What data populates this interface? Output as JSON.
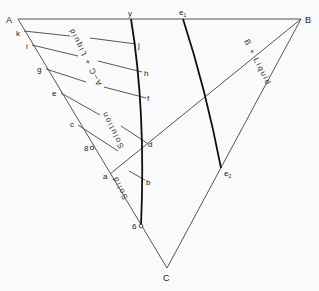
{
  "diagram": {
    "type": "ternary-phase-diagram",
    "vertices": {
      "A": "A",
      "B": "B",
      "C": "C"
    },
    "point_labels": {
      "y": "y",
      "e1": "e",
      "e1_sub": "1",
      "e2": "e",
      "e2_sub": "2",
      "k": "k",
      "i": "i",
      "g": "g",
      "e": "e",
      "c": "c",
      "p8": "8",
      "a": "a",
      "p6": "6",
      "j": "j",
      "h": "h",
      "f": "f",
      "d": "d",
      "b": "b"
    },
    "regions": {
      "ac_liquid": "A–C + Liquid",
      "solution": "Solution",
      "solid": "Solid",
      "b_liquid": "B + Liquid"
    },
    "tie_lines": [
      [
        "k",
        "j"
      ],
      [
        "i",
        "h"
      ],
      [
        "g",
        "f"
      ],
      [
        "e",
        "d"
      ],
      [
        "c",
        "b"
      ]
    ],
    "boundary_curves": [
      [
        "y",
        "j",
        "h",
        "f",
        "d",
        "b",
        "6"
      ],
      [
        "e1",
        "e2"
      ]
    ],
    "join_lines": [
      [
        "a",
        "B"
      ],
      [
        "e2",
        "B"
      ]
    ]
  }
}
